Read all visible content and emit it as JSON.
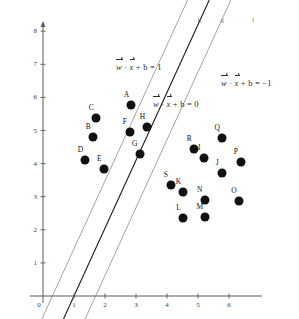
{
  "chart_data": {
    "type": "scatter",
    "title": "",
    "xlabel": "",
    "ylabel": "",
    "xlim": [
      0,
      6.8
    ],
    "ylim": [
      0,
      8.4
    ],
    "grid": false,
    "legend_position": "none",
    "x_ticks": [
      "0",
      "1",
      "2",
      "3",
      "4",
      "5",
      "6"
    ],
    "y_ticks": [
      "0",
      "1",
      "2",
      "3",
      "4",
      "5",
      "6",
      "7",
      "8"
    ],
    "points": [
      {
        "label": "A",
        "x": 2.85,
        "y": 5.78,
        "class": "positive"
      },
      {
        "label": "B",
        "x": 1.62,
        "y": 4.8,
        "class": "positive"
      },
      {
        "label": "C",
        "x": 1.72,
        "y": 5.38,
        "class": "positive"
      },
      {
        "label": "D",
        "x": 1.37,
        "y": 4.1,
        "class": "positive"
      },
      {
        "label": "E",
        "x": 1.98,
        "y": 3.83,
        "class": "positive"
      },
      {
        "label": "F",
        "x": 2.8,
        "y": 4.95,
        "class": "positive"
      },
      {
        "label": "G",
        "x": 3.12,
        "y": 4.28,
        "class": "positive"
      },
      {
        "label": "H",
        "x": 3.37,
        "y": 5.1,
        "class": "positive"
      },
      {
        "label": "I",
        "x": 5.2,
        "y": 4.18,
        "class": "negative"
      },
      {
        "label": "J",
        "x": 5.78,
        "y": 3.72,
        "class": "negative"
      },
      {
        "label": "K",
        "x": 4.53,
        "y": 3.13,
        "class": "negative"
      },
      {
        "label": "L",
        "x": 4.53,
        "y": 2.37,
        "class": "negative"
      },
      {
        "label": "M",
        "x": 5.22,
        "y": 2.4,
        "class": "negative"
      },
      {
        "label": "N",
        "x": 5.22,
        "y": 2.9,
        "class": "negative"
      },
      {
        "label": "O",
        "x": 6.32,
        "y": 2.87,
        "class": "negative"
      },
      {
        "label": "P",
        "x": 6.38,
        "y": 4.05,
        "class": "negative"
      },
      {
        "label": "Q",
        "x": 5.78,
        "y": 4.78,
        "class": "negative"
      },
      {
        "label": "R",
        "x": 4.88,
        "y": 4.45,
        "class": "negative"
      },
      {
        "label": "S",
        "x": 4.12,
        "y": 3.35,
        "class": "negative"
      }
    ],
    "lines": [
      {
        "name": "h",
        "label": "h",
        "equation_label": "w⃗ · x⃗ + b = 1",
        "color": "#9a9a9a",
        "slope": 2.05,
        "intercept": -0.62,
        "label_x": 5.05,
        "label_y": 8.35
      },
      {
        "name": "g",
        "label": "g",
        "equation_label": "w⃗ · x⃗ + b = 0",
        "color": "#1a1a1a",
        "slope": 2.05,
        "intercept": -2.05,
        "label_x": 5.78,
        "label_y": 8.35
      },
      {
        "name": "l",
        "label": "l",
        "equation_label": "w⃗ · x⃗ + b = −1",
        "color": "#9a9a9a",
        "slope": 2.05,
        "intercept": -3.48,
        "label_x": 6.78,
        "label_y": 8.35
      }
    ],
    "annotations": [
      {
        "id": "eq-pos",
        "text": "w⃗ · x⃗ + b = 1",
        "x": 116,
        "y": 62
      },
      {
        "id": "eq-zero",
        "text": "w⃗ · x⃗ + b = 0",
        "x": 153,
        "y": 99
      },
      {
        "id": "eq-neg",
        "text": "w⃗ · x⃗ + b = −1",
        "x": 221,
        "y": 78
      }
    ]
  },
  "axis": {
    "origin_px": {
      "x": 43,
      "y": 296
    },
    "unit_px": {
      "x": 31.0,
      "y": 33.1
    }
  },
  "equations": {
    "margin_positive": {
      "w": "w",
      "x": "x",
      "rest": " + b = 1"
    },
    "hyperplane": {
      "w": "w",
      "x": "x",
      "rest": " + b = 0"
    },
    "margin_negative": {
      "w": "w",
      "x": "x",
      "rest": " + b = −1"
    }
  },
  "colors": {
    "axis": "#5a5a5a",
    "point": "#111111",
    "margin_line": "#9a9a9a",
    "decision_line": "#1a1a1a",
    "background": "#ffffff"
  }
}
